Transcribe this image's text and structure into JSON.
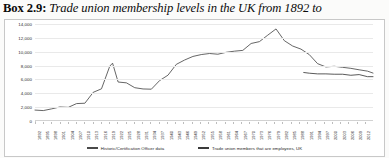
{
  "caption": {
    "box_label": "Box 2.9:",
    "title": "Trade union membership levels in the UK from 1892 to"
  },
  "legend": {
    "items": [
      {
        "label": "Historic/Certification Officer data",
        "color": "#4a4a4a"
      },
      {
        "label": "Trade union members that are employees, UK",
        "color": "#3b3b3b"
      }
    ]
  },
  "chart_data": {
    "type": "line",
    "title": "Trade union membership levels in the UK from 1892 to",
    "xlabel": "",
    "ylabel": "",
    "ylim": [
      0,
      14000
    ],
    "yticks": [
      0,
      2000,
      4000,
      6000,
      8000,
      10000,
      12000,
      14000
    ],
    "ytick_labels": [
      "0",
      "2,000",
      "4,000",
      "6,000",
      "8,000",
      "10,000",
      "12,000",
      "14,000"
    ],
    "grid": true,
    "legend_position": "bottom",
    "xlim": [
      1892,
      2014
    ],
    "xtick_labels": [
      "1892",
      "1895",
      "1898",
      "1901",
      "1904",
      "1907",
      "1910",
      "1913",
      "1916",
      "1919",
      "1922",
      "1925",
      "1928",
      "1931",
      "1934",
      "1937",
      "1940",
      "1943",
      "1946",
      "1949",
      "1952",
      "1955",
      "1958",
      "1961",
      "1964",
      "1967",
      "1970",
      "1973",
      "1976",
      "1979",
      "1982",
      "1985",
      "1988",
      "1991",
      "1994",
      "1997",
      "2000",
      "2003",
      "2006",
      "2009",
      "2012",
      "2014"
    ],
    "series": [
      {
        "name": "Historic/Certification Officer data",
        "color": "#4a4a4a",
        "x": [
          1892,
          1895,
          1898,
          1901,
          1904,
          1907,
          1910,
          1913,
          1916,
          1919,
          1920,
          1922,
          1925,
          1928,
          1931,
          1934,
          1937,
          1940,
          1943,
          1946,
          1949,
          1952,
          1955,
          1958,
          1961,
          1964,
          1967,
          1970,
          1973,
          1976,
          1979,
          1982,
          1985,
          1988,
          1991,
          1994,
          1997,
          2000,
          2003,
          2006,
          2009,
          2012,
          2014
        ],
        "values": [
          1576,
          1504,
          1752,
          2025,
          1967,
          2513,
          2565,
          4135,
          4644,
          7926,
          8348,
          5625,
          5506,
          4806,
          4624,
          4590,
          5842,
          6613,
          8174,
          8803,
          9318,
          9588,
          9741,
          9639,
          9916,
          10079,
          10190,
          11187,
          11456,
          12386,
          13289,
          11593,
          10821,
          10376,
          9585,
          8278,
          7801,
          7898,
          7751,
          7602,
          7390,
          7197,
          6918
        ],
        "note": "Peak 13,289 thousand in 1979; post-WWI spike 8,348 thousand in 1920"
      },
      {
        "name": "Trade union members that are employees, UK",
        "color": "#3b3b3b",
        "x": [
          1989,
          1991,
          1994,
          1997,
          2000,
          2003,
          2006,
          2009,
          2012,
          2014
        ],
        "values": [
          7000,
          6900,
          6800,
          6800,
          6750,
          6750,
          6600,
          6700,
          6400,
          6400
        ],
        "note": "Labour Force Survey based series, begins late 1980s"
      }
    ],
    "units": "thousands of members"
  }
}
